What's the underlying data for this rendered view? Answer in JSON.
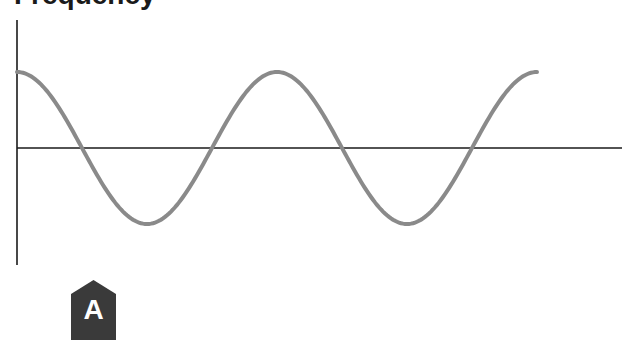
{
  "title": "Frequency",
  "badge": {
    "label": "A",
    "color": "#3a3a3a"
  },
  "colors": {
    "wave": "#8a8a8a",
    "axis": "#1a1a1a"
  },
  "chart_data": {
    "type": "line",
    "title": "Frequency",
    "xlabel": "",
    "ylabel": "",
    "grid": false,
    "x": [
      0,
      0.25,
      0.5,
      0.75,
      1.0,
      1.25,
      1.5,
      1.75,
      2.0
    ],
    "values": [
      1,
      0,
      -1,
      0,
      1,
      0,
      -1,
      0,
      1
    ],
    "ylim": [
      -1,
      1
    ]
  }
}
